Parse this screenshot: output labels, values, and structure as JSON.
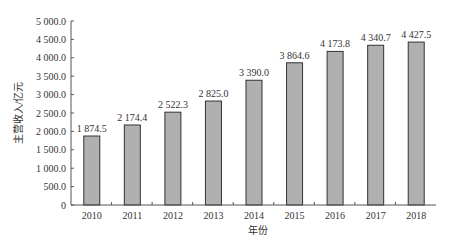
{
  "chart_data": {
    "type": "bar",
    "title": "",
    "xlabel": "年份",
    "ylabel": "主营收入/亿元",
    "categories": [
      "2010",
      "2011",
      "2012",
      "2013",
      "2014",
      "2015",
      "2016",
      "2017",
      "2018"
    ],
    "values": [
      1874.5,
      2174.4,
      2522.3,
      2825.0,
      3390.0,
      3864.6,
      4173.8,
      4340.7,
      4427.5
    ],
    "value_labels": [
      "1 874.5",
      "2 174.4",
      "2 522.3",
      "2 825.0",
      "3 390.0",
      "3 864.6",
      "4 173.8",
      "4 340.7",
      "4 427.5"
    ],
    "ylim": [
      0,
      5000
    ],
    "yticks": [
      "0",
      "500.0",
      "1 000.0",
      "1 500.0",
      "2 000.0",
      "2 500.0",
      "3 000.0",
      "3 500.0",
      "4 000.0",
      "4 500.0",
      "5 000.0"
    ],
    "grid": false,
    "bar_color": "#b0b0b0",
    "bar_edge_color": "#333333"
  }
}
